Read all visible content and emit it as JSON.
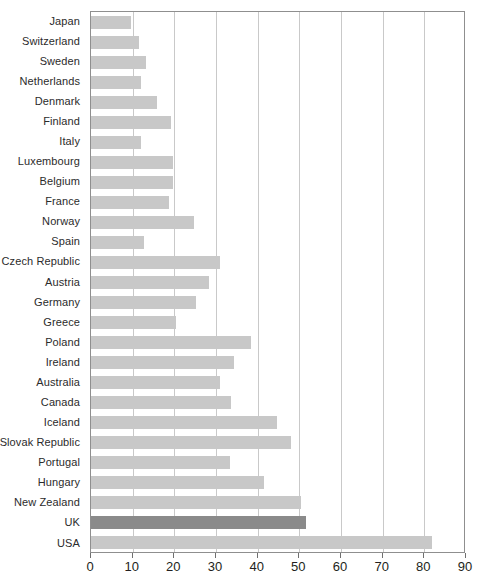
{
  "chart_data": {
    "type": "bar",
    "orientation": "horizontal",
    "title": "",
    "subtitle": "",
    "xlabel": "",
    "ylabel": "",
    "xlim": [
      0,
      90
    ],
    "xticks": [
      0,
      10,
      20,
      30,
      40,
      50,
      60,
      70,
      80,
      90
    ],
    "xtick_labels": [
      "0",
      "10",
      "20",
      "30",
      "40",
      "50",
      "60",
      "70",
      "80",
      "90"
    ],
    "grid": "vertical",
    "legend": "none",
    "categories": [
      "Japan",
      "Switzerland",
      "Sweden",
      "Netherlands",
      "Denmark",
      "Finland",
      "Italy",
      "Luxembourg",
      "Belgium",
      "France",
      "Norway",
      "Spain",
      "Czech Republic",
      "Austria",
      "Germany",
      "Greece",
      "Poland",
      "Ireland",
      "Australia",
      "Canada",
      "Iceland",
      "Slovak Republic",
      "Portugal",
      "Hungary",
      "New Zealand",
      "UK",
      "USA"
    ],
    "values": [
      9.5,
      11.5,
      13.2,
      12.1,
      15.8,
      19.3,
      11.9,
      19.6,
      19.6,
      18.6,
      24.6,
      12.8,
      30.9,
      28.4,
      25.3,
      20.4,
      38.3,
      34.2,
      30.9,
      33.5,
      44.7,
      48.1,
      33.3,
      41.6,
      50.5,
      51.7,
      81.8
    ],
    "highlight_category": "UK",
    "colors": {
      "bar": "#c8c8c8",
      "bar_highlight": "#8a8a8a",
      "gridline": "#c9c9c9",
      "axis": "#8f8f8f",
      "text": "#231f20"
    }
  }
}
